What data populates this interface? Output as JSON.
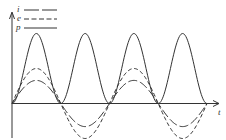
{
  "diagram": {
    "type": "waveform",
    "axis": {
      "x_label": "t"
    },
    "legend": [
      {
        "symbol": "i",
        "style": "long-dash"
      },
      {
        "symbol": "e",
        "style": "short-dash"
      },
      {
        "symbol": "p",
        "style": "solid"
      }
    ],
    "colors": {
      "line": "#333333",
      "background": "#ffffff"
    }
  },
  "chart_data": {
    "type": "line",
    "title": "",
    "xlabel": "t",
    "ylabel": "",
    "legend": [
      "i",
      "e",
      "p"
    ],
    "series": [
      {
        "name": "i",
        "shape": "sinusoid",
        "relative_amplitude": 0.33,
        "half_cycles": 4,
        "style": "long-dash"
      },
      {
        "name": "e",
        "shape": "sinusoid",
        "relative_amplitude": 0.5,
        "half_cycles": 4,
        "style": "short-dash"
      },
      {
        "name": "p",
        "shape": "sin^2 (always positive)",
        "relative_amplitude": 1.0,
        "half_cycles": 4,
        "style": "solid"
      }
    ],
    "grid": false,
    "legend_position": "top-left"
  }
}
